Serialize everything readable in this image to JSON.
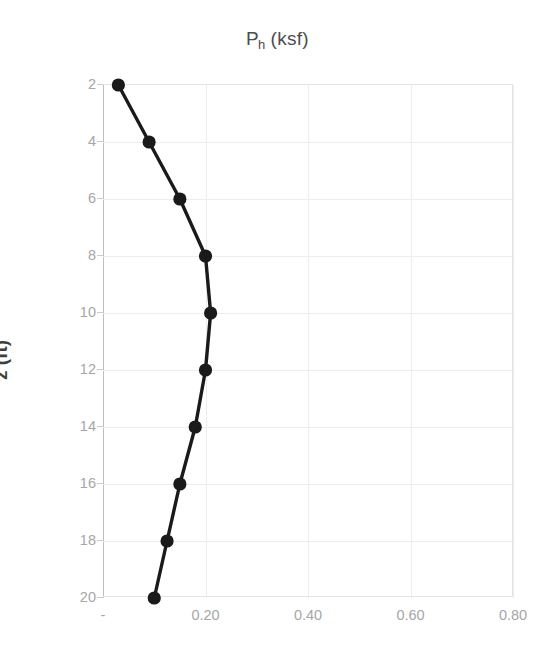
{
  "chart_data": {
    "type": "line",
    "title_main": "P",
    "title_subscript": "h",
    "title_unit": "(ksf)",
    "xlabel": "",
    "ylabel": "z (ft)",
    "x": [
      0.03,
      0.09,
      0.15,
      0.2,
      0.21,
      0.2,
      0.18,
      0.15,
      0.125,
      0.1
    ],
    "y": [
      2,
      4,
      6,
      8,
      10,
      12,
      14,
      16,
      18,
      20
    ],
    "series": [
      {
        "name": "Ph",
        "x_values": [
          0.03,
          0.09,
          0.15,
          0.2,
          0.21,
          0.2,
          0.18,
          0.15,
          0.125,
          0.1
        ],
        "y_values": [
          2,
          4,
          6,
          8,
          10,
          12,
          14,
          16,
          18,
          20
        ]
      }
    ],
    "xlim": [
      0.0,
      0.8
    ],
    "ylim": [
      2,
      20
    ],
    "y_inverted": true,
    "xticks": [
      0.0,
      0.2,
      0.4,
      0.6,
      0.8
    ],
    "xtick_labels": [
      "-",
      "0.20",
      "0.40",
      "0.60",
      "0.80"
    ],
    "yticks": [
      2,
      4,
      6,
      8,
      10,
      12,
      14,
      16,
      18,
      20
    ],
    "ytick_labels": [
      "2",
      "4",
      "6",
      "8",
      "10",
      "12",
      "14",
      "16",
      "18",
      "20"
    ],
    "grid": true,
    "legend": false,
    "legend_position": "none",
    "line_color": "#1a1a1a",
    "marker": "circle",
    "gridline_color": "#ededed",
    "axis_color": "#bfbfbf",
    "tick_label_color": "#a6a6a6",
    "title_color": "#4d4d4d",
    "background_color": "#ffffff"
  }
}
